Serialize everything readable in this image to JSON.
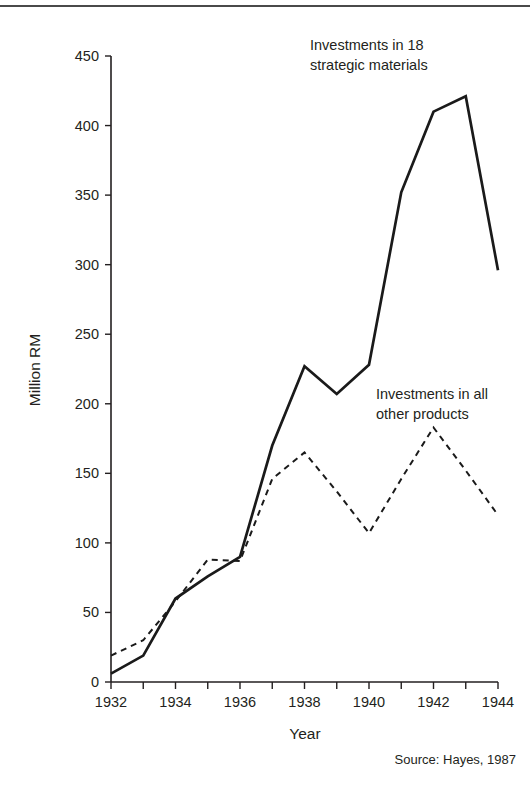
{
  "page": {
    "source_note": "Source: Hayes, 1987"
  },
  "chart_data": {
    "type": "line",
    "title": "",
    "xlabel": "Year",
    "ylabel": "Million RM",
    "xlim": [
      1932,
      1944
    ],
    "ylim": [
      0,
      450
    ],
    "grid": false,
    "legend_position": "inline-annotations",
    "x": [
      1932,
      1933,
      1934,
      1935,
      1936,
      1937,
      1938,
      1939,
      1940,
      1941,
      1942,
      1943,
      1944
    ],
    "xticks_major": [
      "1932",
      "1934",
      "1936",
      "1938",
      "1940",
      "1942",
      "1944"
    ],
    "yticks": [
      "0",
      "50",
      "100",
      "150",
      "200",
      "250",
      "300",
      "350",
      "400",
      "450"
    ],
    "series": [
      {
        "name": "Investments in 18 strategic materials",
        "style": "solid",
        "annotation": "Investments in 18\nstrategic materials",
        "values": [
          6,
          19,
          60,
          76,
          90,
          170,
          227,
          207,
          228,
          352,
          410,
          421,
          296
        ]
      },
      {
        "name": "Investments in all other products",
        "style": "dashed",
        "annotation": "Investments in all\nother products",
        "values": [
          19,
          30,
          58,
          88,
          87,
          146,
          165,
          137,
          107,
          146,
          183,
          152,
          120
        ]
      }
    ]
  }
}
